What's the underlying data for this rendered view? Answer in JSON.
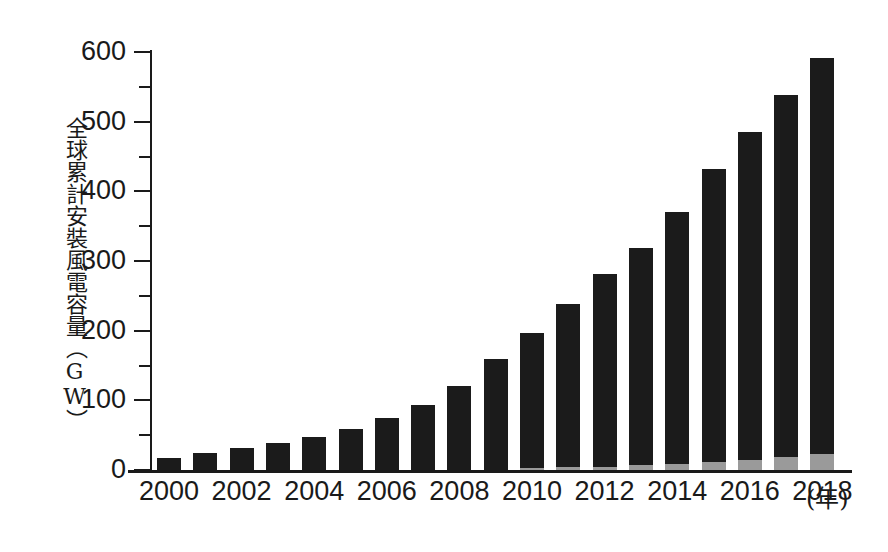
{
  "chart_data": {
    "type": "bar",
    "title": "",
    "subtitle": "",
    "xlabel": "(年)",
    "ylabel": "全球累計安裝風電容量（GW）",
    "xlim": [
      1999.5,
      2018.5
    ],
    "ylim": [
      0,
      600
    ],
    "grid": false,
    "legend_position": "none",
    "y_ticks_major": [
      0,
      100,
      200,
      300,
      400,
      500,
      600
    ],
    "y_ticks_minor": [
      50,
      150,
      250,
      350,
      450,
      550
    ],
    "y_tick_labels": [
      "0",
      "100",
      "200",
      "300",
      "400",
      "500",
      "600"
    ],
    "categories": [
      "2000",
      "2001",
      "2002",
      "2003",
      "2004",
      "2005",
      "2006",
      "2007",
      "2008",
      "2009",
      "2010",
      "2011",
      "2012",
      "2013",
      "2014",
      "2015",
      "2016",
      "2017",
      "2018"
    ],
    "x_tick_labels": [
      "2000",
      "2002",
      "2004",
      "2006",
      "2008",
      "2010",
      "2012",
      "2014",
      "2016",
      "2018"
    ],
    "stacked": true,
    "series": [
      {
        "name": "offshore",
        "color": "#9a9a9a",
        "values": [
          0,
          0,
          0,
          0,
          0,
          0,
          0,
          0,
          0,
          0,
          3,
          4,
          5,
          7,
          9,
          12,
          14,
          19,
          23
        ]
      },
      {
        "name": "onshore",
        "color": "#1b1b1b",
        "values": [
          17,
          24,
          31,
          39,
          47,
          59,
          74,
          94,
          121,
          159,
          194,
          234,
          277,
          311,
          361,
          420,
          471,
          520,
          568
        ]
      }
    ],
    "totals": [
      17,
      24,
      31,
      39,
      47,
      59,
      74,
      94,
      121,
      159,
      197,
      238,
      282,
      318,
      370,
      432,
      485,
      539,
      591
    ]
  },
  "axis": {
    "y_title": "全球累計安裝風電容量（GW）",
    "x_unit": "(年)"
  }
}
